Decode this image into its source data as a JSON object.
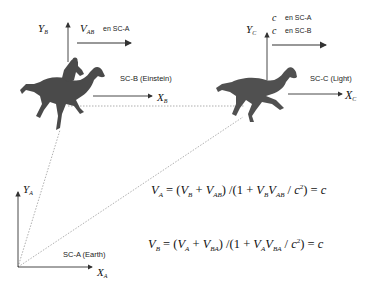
{
  "frames": {
    "A": {
      "name": "SC-A (Earth)",
      "x_axis": "X",
      "x_sub": "A",
      "y_axis": "Y",
      "y_sub": "A"
    },
    "B": {
      "name": "SC-B (Einstein)",
      "x_axis": "X",
      "x_sub": "B",
      "y_axis": "Y",
      "y_sub": "B"
    },
    "C": {
      "name": "SC-C (Light)",
      "x_axis": "X",
      "x_sub": "C",
      "y_axis": "Y",
      "y_sub": "C"
    }
  },
  "velocity_labels": {
    "vab": {
      "symbol": "V",
      "sub": "AB",
      "note": "en SC-A"
    },
    "c_in_a": {
      "symbol": "c",
      "note": "en SC-A"
    },
    "c_in_b": {
      "symbol": "c",
      "note": "en SC-B"
    }
  },
  "equations": {
    "eq1": {
      "lhs": "V",
      "lhs_sub": "A",
      "t1": "V",
      "t1_sub": "B",
      "t2": "V",
      "t2_sub": "AB",
      "d1": "V",
      "d1_sub": "B",
      "d2": "V",
      "d2_sub": "AB",
      "result": "c"
    },
    "eq2": {
      "lhs": "V",
      "lhs_sub": "B",
      "t1": "V",
      "t1_sub": "A",
      "t2": "V",
      "t2_sub": "BA",
      "d1": "V",
      "d1_sub": "A",
      "d2": "V",
      "d2_sub": "BA",
      "result": "c"
    }
  },
  "colors": {
    "axis": "#333333",
    "dotted": "#9a9a9a",
    "horse": "#4a4a4a",
    "text": "#111111"
  }
}
